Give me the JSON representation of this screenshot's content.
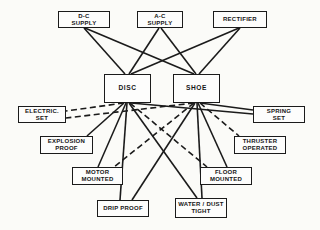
{
  "figure": {
    "type": "block-diagram",
    "background_color": "#fbfbf8",
    "ink_color": "#1b1b1b",
    "box_fill_color": "#fdfdfc",
    "line_styles_present": [
      "solid",
      "dashed"
    ]
  },
  "nodes": [
    {
      "id": "dc-supply",
      "label": [
        "D-C",
        "SUPPLY"
      ],
      "x": 58,
      "y": 11,
      "w": 52,
      "h": 17,
      "big": false
    },
    {
      "id": "ac-supply",
      "label": [
        "A-C",
        "SUPPLY"
      ],
      "x": 137,
      "y": 11,
      "w": 46,
      "h": 17,
      "big": false
    },
    {
      "id": "rectifier",
      "label": [
        "RECTIFIER"
      ],
      "x": 213,
      "y": 11,
      "w": 54,
      "h": 17,
      "big": false
    },
    {
      "id": "disc",
      "label": [
        "DISC"
      ],
      "x": 104,
      "y": 74,
      "w": 47,
      "h": 29,
      "big": true
    },
    {
      "id": "shoe",
      "label": [
        "SHOE"
      ],
      "x": 173,
      "y": 74,
      "w": 47,
      "h": 29,
      "big": true
    },
    {
      "id": "electric-set",
      "label": [
        "ELECTRIC.",
        "SET"
      ],
      "x": 18,
      "y": 106,
      "w": 48,
      "h": 17,
      "big": false
    },
    {
      "id": "spring-set",
      "label": [
        "SPRING",
        "SET"
      ],
      "x": 253,
      "y": 106,
      "w": 52,
      "h": 17,
      "big": false
    },
    {
      "id": "explosion-proof",
      "label": [
        "EXPLOSION",
        "PROOF"
      ],
      "x": 40,
      "y": 136,
      "w": 53,
      "h": 18,
      "big": false
    },
    {
      "id": "thruster-operated",
      "label": [
        "THRUSTER",
        "OPERATED"
      ],
      "x": 234,
      "y": 136,
      "w": 52,
      "h": 18,
      "big": false
    },
    {
      "id": "motor-mounted",
      "label": [
        "MOTOR",
        "MOUNTED"
      ],
      "x": 72,
      "y": 167,
      "w": 51,
      "h": 18,
      "big": false
    },
    {
      "id": "floor-mounted",
      "label": [
        "FLOOR",
        "MOUNTED"
      ],
      "x": 200,
      "y": 167,
      "w": 52,
      "h": 18,
      "big": false
    },
    {
      "id": "drip-proof",
      "label": [
        "DRIP PROOF"
      ],
      "x": 97,
      "y": 200,
      "w": 52,
      "h": 17,
      "big": false
    },
    {
      "id": "water-dust-tight",
      "label": [
        "WATER / DUST",
        "TIGHT"
      ],
      "x": 175,
      "y": 198,
      "w": 52,
      "h": 20,
      "big": false
    }
  ],
  "edges": [
    {
      "from": "dc-supply",
      "to": "disc",
      "style": "solid",
      "x1": 84,
      "y1": 28,
      "x2": 125,
      "y2": 74
    },
    {
      "from": "dc-supply",
      "to": "shoe",
      "style": "solid",
      "x1": 85,
      "y1": 28,
      "x2": 194,
      "y2": 74
    },
    {
      "from": "ac-supply",
      "to": "disc",
      "style": "solid",
      "x1": 159,
      "y1": 28,
      "x2": 129,
      "y2": 74
    },
    {
      "from": "ac-supply",
      "to": "shoe",
      "style": "solid",
      "x1": 161,
      "y1": 28,
      "x2": 196,
      "y2": 74
    },
    {
      "from": "rectifier",
      "to": "disc",
      "style": "solid",
      "x1": 239,
      "y1": 28,
      "x2": 131,
      "y2": 74
    },
    {
      "from": "rectifier",
      "to": "shoe",
      "style": "solid",
      "x1": 240,
      "y1": 28,
      "x2": 199,
      "y2": 74
    },
    {
      "from": "disc",
      "to": "electric-set",
      "style": "dashed",
      "x1": 124,
      "y1": 103,
      "x2": 66,
      "y2": 111
    },
    {
      "from": "shoe",
      "to": "electric-set",
      "style": "dashed",
      "x1": 194,
      "y1": 103,
      "x2": 66,
      "y2": 118
    },
    {
      "from": "disc",
      "to": "explosion-proof",
      "style": "solid",
      "x1": 124,
      "y1": 103,
      "x2": 87,
      "y2": 136
    },
    {
      "from": "disc",
      "to": "motor-mounted",
      "style": "solid",
      "x1": 126,
      "y1": 103,
      "x2": 98,
      "y2": 167
    },
    {
      "from": "shoe",
      "to": "motor-mounted",
      "style": "dashed",
      "x1": 194,
      "y1": 103,
      "x2": 114,
      "y2": 167
    },
    {
      "from": "disc",
      "to": "drip-proof",
      "style": "solid",
      "x1": 127,
      "y1": 103,
      "x2": 120,
      "y2": 200
    },
    {
      "from": "shoe",
      "to": "drip-proof",
      "style": "solid",
      "x1": 195,
      "y1": 103,
      "x2": 132,
      "y2": 200
    },
    {
      "from": "disc",
      "to": "water-dust-tight",
      "style": "solid",
      "x1": 129,
      "y1": 103,
      "x2": 197,
      "y2": 198
    },
    {
      "from": "shoe",
      "to": "water-dust-tight",
      "style": "solid",
      "x1": 197,
      "y1": 103,
      "x2": 202,
      "y2": 198
    },
    {
      "from": "shoe",
      "to": "floor-mounted",
      "style": "solid",
      "x1": 198,
      "y1": 103,
      "x2": 227,
      "y2": 167
    },
    {
      "from": "disc",
      "to": "floor-mounted",
      "style": "dashed",
      "x1": 130,
      "y1": 103,
      "x2": 207,
      "y2": 167
    },
    {
      "from": "shoe",
      "to": "thruster-operated",
      "style": "dashed",
      "x1": 200,
      "y1": 103,
      "x2": 239,
      "y2": 136
    },
    {
      "from": "disc",
      "to": "spring-set",
      "style": "solid",
      "x1": 131,
      "y1": 103,
      "x2": 253,
      "y2": 114
    },
    {
      "from": "shoe",
      "to": "spring-set",
      "style": "solid",
      "x1": 200,
      "y1": 103,
      "x2": 253,
      "y2": 110
    }
  ]
}
